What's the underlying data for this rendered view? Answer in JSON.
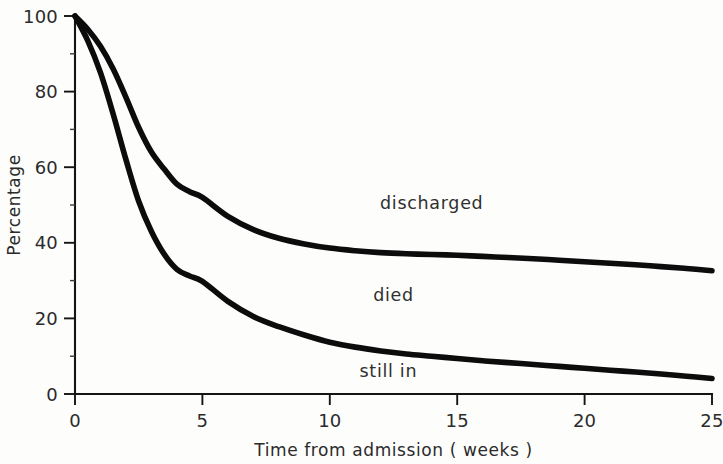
{
  "chart_data": {
    "type": "area",
    "title": "",
    "subtitle": "",
    "xlabel": "Time from admission ( weeks )",
    "ylabel": "Percentage",
    "xlim": [
      0,
      25
    ],
    "ylim": [
      0,
      100
    ],
    "grid": false,
    "legend_position": "inline-annotations",
    "xticks": [
      0,
      5,
      10,
      15,
      20,
      25
    ],
    "xtick_labels": [
      "0",
      "5",
      "10",
      "15",
      "20",
      "25"
    ],
    "yticks": [
      0,
      20,
      40,
      60,
      80,
      100
    ],
    "ytick_labels": [
      "0",
      "20",
      "40",
      "60",
      "80",
      "100"
    ],
    "yminor_ticks": [
      10,
      30,
      50,
      70,
      90
    ],
    "annotations": [
      {
        "text": "discharged",
        "x": 14.0,
        "y": 49.0
      },
      {
        "text": "died",
        "x": 12.5,
        "y": 24.5
      },
      {
        "text": "still  in",
        "x": 12.3,
        "y": 4.5
      }
    ],
    "x": [
      0,
      0.5,
      1,
      1.5,
      2,
      2.5,
      3,
      3.5,
      4,
      4.5,
      5,
      6,
      7,
      8,
      9,
      10,
      11,
      12,
      13,
      14,
      15,
      16,
      17,
      18,
      19,
      20,
      21,
      22,
      23,
      24,
      25
    ],
    "series": [
      {
        "name": "discharged-boundary",
        "description": "Upper curve: percentage not yet discharged (top of discharged band)",
        "values": [
          100,
          96.5,
          92.0,
          86.0,
          78.5,
          70.5,
          64.0,
          59.5,
          55.5,
          53.5,
          52.0,
          47.0,
          43.5,
          41.2,
          39.7,
          38.6,
          37.9,
          37.4,
          37.1,
          36.9,
          36.7,
          36.4,
          36.1,
          35.8,
          35.4,
          35.0,
          34.6,
          34.2,
          33.7,
          33.2,
          32.6
        ]
      },
      {
        "name": "still-in-boundary",
        "description": "Lower curve: percentage still in hospital (top of still-in band)",
        "values": [
          100,
          93.5,
          85.0,
          74.0,
          62.0,
          51.0,
          43.0,
          37.0,
          33.0,
          31.2,
          29.8,
          24.5,
          20.5,
          17.8,
          15.6,
          13.7,
          12.4,
          11.4,
          10.6,
          10.0,
          9.4,
          8.8,
          8.3,
          7.8,
          7.3,
          6.8,
          6.3,
          5.8,
          5.3,
          4.7,
          4.1
        ]
      }
    ],
    "bands": [
      {
        "name": "discharged",
        "label": "discharged",
        "between": [
          "discharged-boundary",
          "ytop-100"
        ]
      },
      {
        "name": "died",
        "label": "died",
        "between": [
          "still-in-boundary",
          "discharged-boundary"
        ]
      },
      {
        "name": "still in",
        "label": "still  in",
        "between": [
          "y0",
          "still-in-boundary"
        ]
      }
    ],
    "colors": {
      "curve": "#0c0c0c",
      "axis": "#141414",
      "text": "#2b2b2b",
      "background": "#fdfdfc"
    }
  },
  "figure": {
    "plot_left_px": 75,
    "plot_right_px": 712,
    "plot_top_px": 16,
    "plot_bottom_px": 394
  }
}
